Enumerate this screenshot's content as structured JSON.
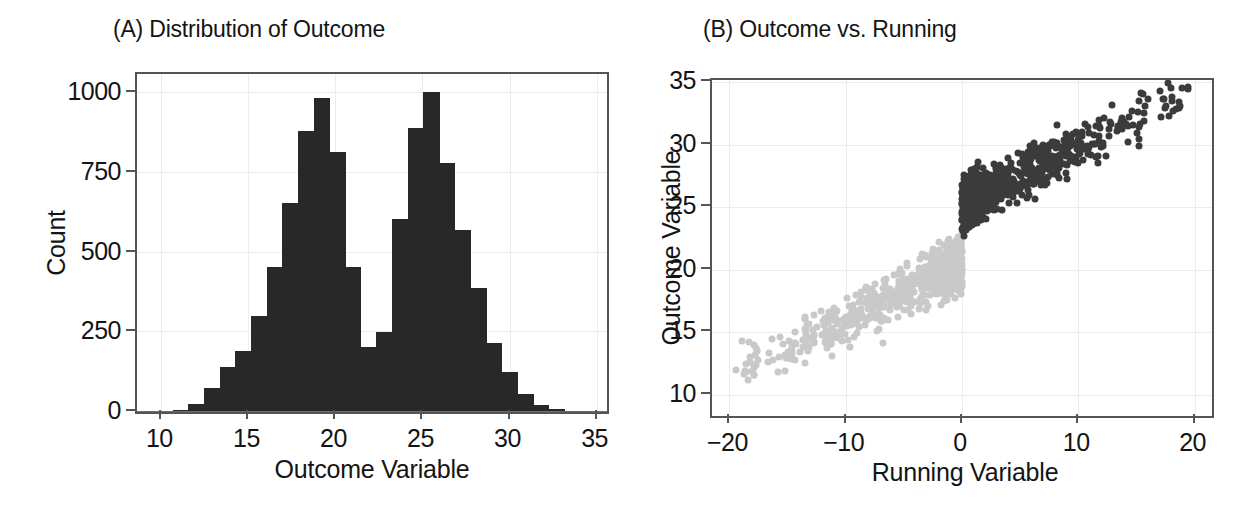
{
  "figure": {
    "panels": [
      {
        "id": "A",
        "title": "(A) Distribution of Outcome"
      },
      {
        "id": "B",
        "title": "(B) Outcome vs. Running"
      }
    ]
  },
  "chart_data": [
    {
      "type": "bar",
      "panel": "A",
      "title": "(A) Distribution of Outcome",
      "xlabel": "Outcome Variable",
      "ylabel": "Count",
      "xlim": [
        8.6,
        35.6
      ],
      "ylim": [
        0,
        1060
      ],
      "xticks": [
        10,
        15,
        20,
        25,
        30,
        35
      ],
      "xtick_labels": [
        "10",
        "15",
        "20",
        "25",
        "30",
        "35"
      ],
      "yticks": [
        0,
        250,
        500,
        750,
        1000
      ],
      "ytick_labels": [
        "0",
        "250",
        "500",
        "750",
        "1000"
      ],
      "grid": true,
      "bin_width": 0.9,
      "bar_color": "#282828",
      "categories": [
        9.3,
        10.2,
        11.1,
        12.0,
        12.9,
        13.8,
        14.7,
        15.6,
        16.5,
        17.4,
        18.3,
        19.2,
        20.1,
        21.0,
        21.9,
        22.8,
        23.7,
        24.6,
        25.5,
        26.4,
        27.3,
        28.2,
        29.1,
        30.0,
        30.9,
        31.8,
        32.7,
        33.6,
        34.5
      ],
      "values": [
        2,
        3,
        5,
        25,
        75,
        140,
        190,
        300,
        455,
        655,
        880,
        985,
        815,
        455,
        205,
        250,
        605,
        890,
        1005,
        780,
        570,
        390,
        215,
        125,
        55,
        22,
        8,
        3,
        2
      ]
    },
    {
      "type": "scatter",
      "panel": "B",
      "title": "(B) Outcome vs. Running",
      "xlabel": "Running Variable",
      "ylabel": "Outcome Variable",
      "xlim": [
        -21.5,
        21.5
      ],
      "ylim": [
        8.3,
        35.2
      ],
      "xticks": [
        -20,
        -10,
        0,
        10,
        20
      ],
      "xtick_labels": [
        "−20",
        "−10",
        "0",
        "10",
        "20"
      ],
      "yticks": [
        10,
        15,
        20,
        25,
        30,
        35
      ],
      "ytick_labels": [
        "10",
        "15",
        "20",
        "25",
        "30",
        "35"
      ],
      "grid": true,
      "cutoff": 0,
      "series": [
        {
          "name": "control",
          "color": "#c9c9c9",
          "slope": 0.46,
          "intercept": 20.6,
          "noise": 0.95,
          "x_range": [
            -19.5,
            0
          ],
          "n": 900
        },
        {
          "name": "treated",
          "color": "#3b3b3b",
          "slope": 0.46,
          "intercept": 25.2,
          "noise": 0.95,
          "x_range": [
            0,
            19.5
          ],
          "n": 900
        }
      ]
    }
  ]
}
